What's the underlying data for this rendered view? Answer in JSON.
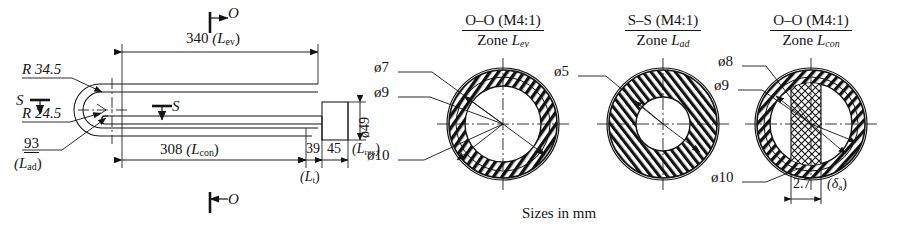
{
  "drawing": {
    "caption": "Sizes in mm",
    "units": "mm"
  },
  "side_view": {
    "name": "heat-pipe-side-view",
    "section_marks": {
      "top_o": "O",
      "bottom_o": "O",
      "left_s": "S",
      "mid_s": "S"
    },
    "labels": {
      "radius_outer": "R 34.5",
      "radius_inner": "R 24.5",
      "adiabatic_len_value": "93",
      "adiabatic_len_sym": "(L",
      "adiabatic_len_sub": "ad",
      "adiabatic_len_close": ")"
    },
    "dimensions": [
      {
        "id": "evaporator-length",
        "value": "340",
        "symbol_open": "(L",
        "symbol_sub": "ev",
        "symbol_close": ")"
      },
      {
        "id": "condenser-length",
        "value": "308",
        "symbol_open": "(L",
        "symbol_sub": "con",
        "symbol_close": ")"
      },
      {
        "id": "transport-length",
        "value": "39",
        "symbol_open": "(L",
        "symbol_sub": "t",
        "symbol_close": ")"
      },
      {
        "id": "reservoir-length",
        "value": "45",
        "symbol_open": "(L",
        "symbol_sub": "res",
        "symbol_close": ")"
      },
      {
        "id": "reservoir-diameter",
        "value": "ø49"
      }
    ]
  },
  "cross_sections": [
    {
      "id": "section-oo-evaporator",
      "title_top": "O–O (M4:1)",
      "title_bot_prefix": "Zone ",
      "title_bot_sym": "L",
      "title_bot_sub": "ev",
      "callouts": [
        {
          "id": "dia-7",
          "text": "ø7"
        },
        {
          "id": "dia-9",
          "text": "ø9"
        },
        {
          "id": "dia-10",
          "text": "ø10"
        }
      ]
    },
    {
      "id": "section-ss-adiabatic",
      "title_top": "S–S (M4:1)",
      "title_bot_prefix": "Zone ",
      "title_bot_sym": "L",
      "title_bot_sub": "ad",
      "callouts": [
        {
          "id": "dia-5",
          "text": "ø5"
        }
      ]
    },
    {
      "id": "section-oo-condenser",
      "title_top": "O–O (M4:1)",
      "title_bot_prefix": "Zone ",
      "title_bot_sym": "L",
      "title_bot_sub": "con",
      "callouts": [
        {
          "id": "dia-8",
          "text": "ø8"
        },
        {
          "id": "dia-9b",
          "text": "ø9"
        },
        {
          "id": "dia-10b",
          "text": "ø10"
        }
      ],
      "wick_thickness": {
        "value": "2.7",
        "sym_open": "(δ",
        "sym_sub": "a",
        "sym_close": ")"
      }
    }
  ],
  "colors": {
    "line": "#141414",
    "background": "#ffffff",
    "hatch": "#111111"
  }
}
